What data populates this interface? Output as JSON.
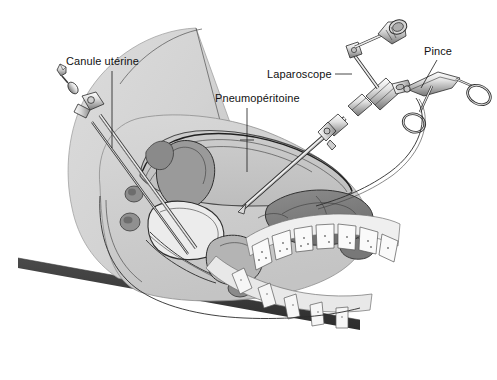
{
  "figure": {
    "background_color": "#ffffff",
    "width": 497,
    "height": 380
  },
  "labels": [
    {
      "id": "canule-uterine",
      "text": "Canule utérine",
      "x": 66,
      "y": 65,
      "anchor": "start",
      "leader": {
        "from_x": 112,
        "from_y": 71,
        "to_x": 112,
        "to_y": 148
      }
    },
    {
      "id": "pneumoperitoine",
      "text": "Pneumopéritoine",
      "x": 215,
      "y": 102,
      "anchor": "start",
      "leader": {
        "from_x": 247,
        "from_y": 108,
        "to_x": 247,
        "to_y": 172
      }
    },
    {
      "id": "laparoscope",
      "text": "Laparoscope",
      "x": 267,
      "y": 78,
      "anchor": "start",
      "leader": {
        "from_x": 335,
        "from_y": 74,
        "to_x": 352,
        "to_y": 74
      }
    },
    {
      "id": "pince",
      "text": "Pince",
      "x": 424,
      "y": 55,
      "anchor": "start",
      "leader": {
        "from_x": 437,
        "from_y": 60,
        "to_x": 421,
        "to_y": 88
      }
    }
  ],
  "anatomy": {
    "parts": [
      {
        "name": "thigh-silhouette",
        "color": "#d5d5d5"
      },
      {
        "name": "abdominal-wall",
        "color": "#cfcfcf"
      },
      {
        "name": "peritoneal-cavity-gas",
        "color": "#c8c8c8"
      },
      {
        "name": "uterus",
        "color": "#8f8f8f"
      },
      {
        "name": "bladder",
        "color": "#e8e8e8"
      },
      {
        "name": "rectum",
        "color": "#b8b8b8"
      },
      {
        "name": "bowel-loops",
        "color": "#7e7e7e"
      },
      {
        "name": "vertebrae",
        "color": "#fafafa"
      },
      {
        "name": "sacrum",
        "color": "#f2f2f2"
      },
      {
        "name": "operating-table",
        "color": "#3b3b3b"
      }
    ]
  },
  "instruments": [
    {
      "name": "uterine-cannula",
      "label_ref": "canule-uterine",
      "parts": [
        "arrow-tip",
        "oval-bulb",
        "handle-clamp",
        "shaft"
      ]
    },
    {
      "name": "laparoscope",
      "label_ref": "laparoscope",
      "parts": [
        "eyepiece-head",
        "light-post",
        "trocar-valve",
        "shaft"
      ]
    },
    {
      "name": "grasping-forceps",
      "label_ref": "pince",
      "parts": [
        "ring-handle-upper",
        "ring-handle-lower",
        "hinge",
        "shaft",
        "cable"
      ]
    }
  ],
  "colors": {
    "ink": "#2b2b2b",
    "label_text": "#111111",
    "table": "#3b3b3b",
    "skin": "#d5d5d5",
    "organ_dark": "#7e7e7e",
    "organ_mid": "#a8a8a8",
    "organ_light": "#e4e4e4"
  }
}
